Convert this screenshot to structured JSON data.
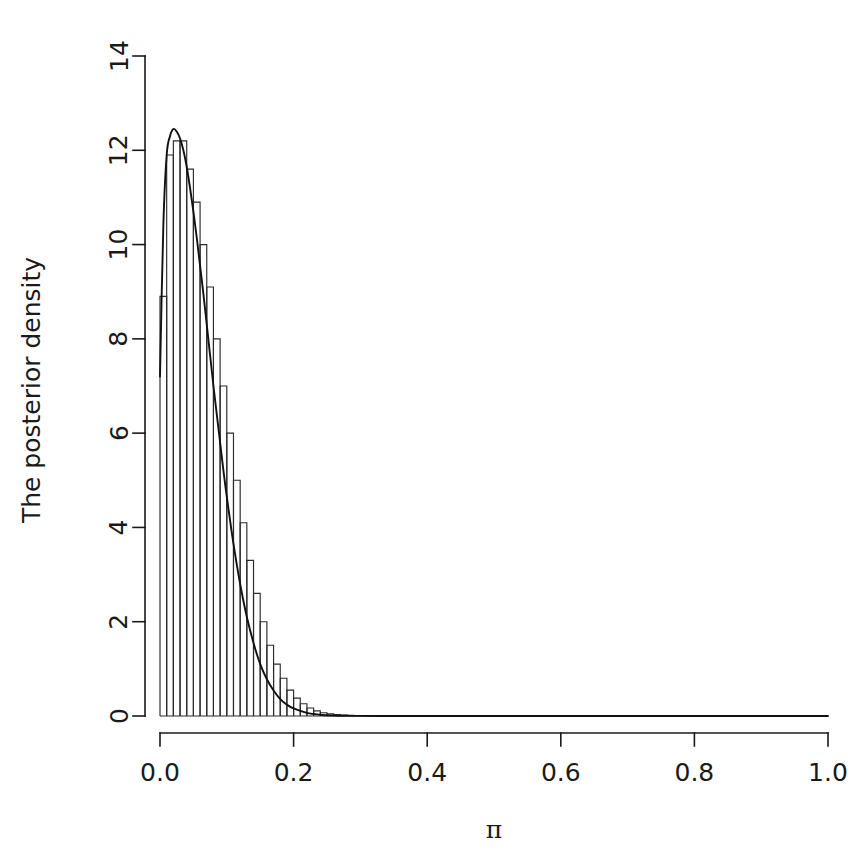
{
  "chart_data": {
    "type": "area",
    "title": "",
    "subtitle": "",
    "xlabel": "π",
    "ylabel": "The posterior density",
    "xlim": [
      0.0,
      1.0
    ],
    "ylim": [
      0,
      14
    ],
    "grid": false,
    "legend": null,
    "x_ticks": [
      "0.0",
      "0.2",
      "0.4",
      "0.6",
      "0.8",
      "1.0"
    ],
    "x_tick_values": [
      0.0,
      0.2,
      0.4,
      0.6,
      0.8,
      1.0
    ],
    "y_ticks": [
      "0",
      "2",
      "4",
      "6",
      "8",
      "10",
      "12",
      "14"
    ],
    "y_tick_values": [
      0,
      2,
      4,
      6,
      8,
      10,
      12,
      14
    ],
    "series": [
      {
        "name": "Posterior histogram",
        "type": "histogram",
        "bin_width": 0.01,
        "bin_left_edges": [
          0.0,
          0.01,
          0.02,
          0.03,
          0.04,
          0.05,
          0.06,
          0.07,
          0.08,
          0.09,
          0.1,
          0.11,
          0.12,
          0.13,
          0.14,
          0.15,
          0.16,
          0.17,
          0.18,
          0.19,
          0.2,
          0.21,
          0.22,
          0.23,
          0.24,
          0.25,
          0.26,
          0.27,
          0.28,
          0.29,
          0.3,
          0.31,
          0.32,
          0.33,
          0.34,
          0.35
        ],
        "values": [
          8.9,
          11.9,
          12.2,
          12.2,
          11.6,
          10.9,
          10.0,
          9.1,
          8.0,
          7.0,
          6.0,
          5.0,
          4.1,
          3.3,
          2.6,
          2.0,
          1.5,
          1.1,
          0.8,
          0.55,
          0.38,
          0.26,
          0.17,
          0.11,
          0.07,
          0.045,
          0.03,
          0.02,
          0.012,
          0.008,
          0.005,
          0.003,
          0.002,
          0.001,
          0.0006,
          0.0003
        ]
      },
      {
        "name": "Smooth posterior density",
        "type": "line",
        "x": [
          0.0,
          0.005,
          0.01,
          0.015,
          0.02,
          0.025,
          0.03,
          0.035,
          0.04,
          0.045,
          0.05,
          0.055,
          0.06,
          0.065,
          0.07,
          0.075,
          0.08,
          0.085,
          0.09,
          0.095,
          0.1,
          0.11,
          0.12,
          0.13,
          0.14,
          0.15,
          0.16,
          0.17,
          0.18,
          0.19,
          0.2,
          0.22,
          0.24,
          0.26,
          0.28,
          0.3,
          0.35,
          0.4,
          0.5,
          0.6,
          0.8,
          1.0
        ],
        "y": [
          7.2,
          10.4,
          11.9,
          12.3,
          12.45,
          12.4,
          12.25,
          12.0,
          11.65,
          11.2,
          10.7,
          10.15,
          9.55,
          8.95,
          8.3,
          7.65,
          7.0,
          6.4,
          5.8,
          5.2,
          4.65,
          3.65,
          2.8,
          2.1,
          1.55,
          1.1,
          0.78,
          0.54,
          0.36,
          0.24,
          0.16,
          0.065,
          0.026,
          0.01,
          0.004,
          0.002,
          0.0004,
          0.0001,
          0.0,
          0.0,
          0.0,
          0.0
        ]
      }
    ],
    "peak": {
      "x": 0.022,
      "y": 12.45
    }
  },
  "axes": {
    "x_label": "π",
    "y_label": "The posterior density"
  }
}
